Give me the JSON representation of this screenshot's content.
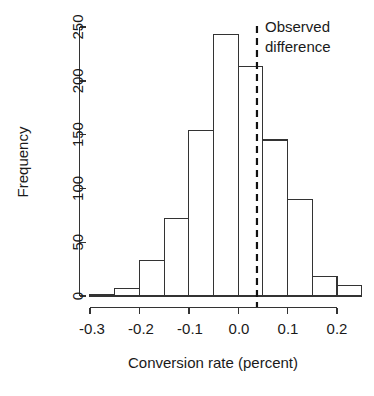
{
  "chart_data": {
    "type": "bar",
    "title": "",
    "subtitle": "",
    "xlabel": "Conversion rate (percent)",
    "ylabel": "Frequency",
    "grid": false,
    "legend": null,
    "xlim": [
      -0.325,
      0.262
    ],
    "ylim": [
      0,
      255
    ],
    "xticks": [
      -0.3,
      -0.2,
      -0.1,
      0.0,
      0.1,
      0.2
    ],
    "xticklabels": [
      "-0.3",
      "-0.2",
      "-0.1",
      "0.0",
      "0.1",
      "0.2"
    ],
    "yticks": [
      0,
      50,
      100,
      150,
      200,
      250
    ],
    "yticklabels": [
      "0",
      "50",
      "100",
      "150",
      "200",
      "250"
    ],
    "bin_width": 0.05,
    "bin_edges": [
      -0.3,
      -0.25,
      -0.2,
      -0.15,
      -0.1,
      -0.05,
      0.0,
      0.05,
      0.1,
      0.15,
      0.2,
      0.25
    ],
    "categories": [
      "-0.30 to -0.25",
      "-0.25 to -0.20",
      "-0.20 to -0.15",
      "-0.15 to -0.10",
      "-0.10 to -0.05",
      "-0.05 to 0.00",
      "0.00 to 0.05",
      "0.05 to 0.10",
      "0.10 to 0.15",
      "0.15 to 0.20",
      "0.20 to 0.25"
    ],
    "values": [
      1,
      7,
      33,
      72,
      154,
      243,
      213,
      145,
      90,
      18,
      10
    ],
    "annotations": [
      {
        "name": "observed-difference",
        "lines": [
          "Observed",
          "difference"
        ],
        "x": 0.038,
        "style": "dashed-vertical-line",
        "color": "#111111"
      }
    ],
    "bar_facecolor": "#ffffff",
    "bar_edgecolor": "#333333"
  },
  "axes": {
    "y_title": "Frequency",
    "x_title": "Conversion rate (percent)"
  },
  "annotation": {
    "line1": "Observed",
    "line2": "difference"
  },
  "ticks": {
    "x": [
      "-0.3",
      "-0.2",
      "-0.1",
      "0.0",
      "0.1",
      "0.2"
    ],
    "y": [
      "0",
      "50",
      "100",
      "150",
      "200",
      "250"
    ]
  }
}
